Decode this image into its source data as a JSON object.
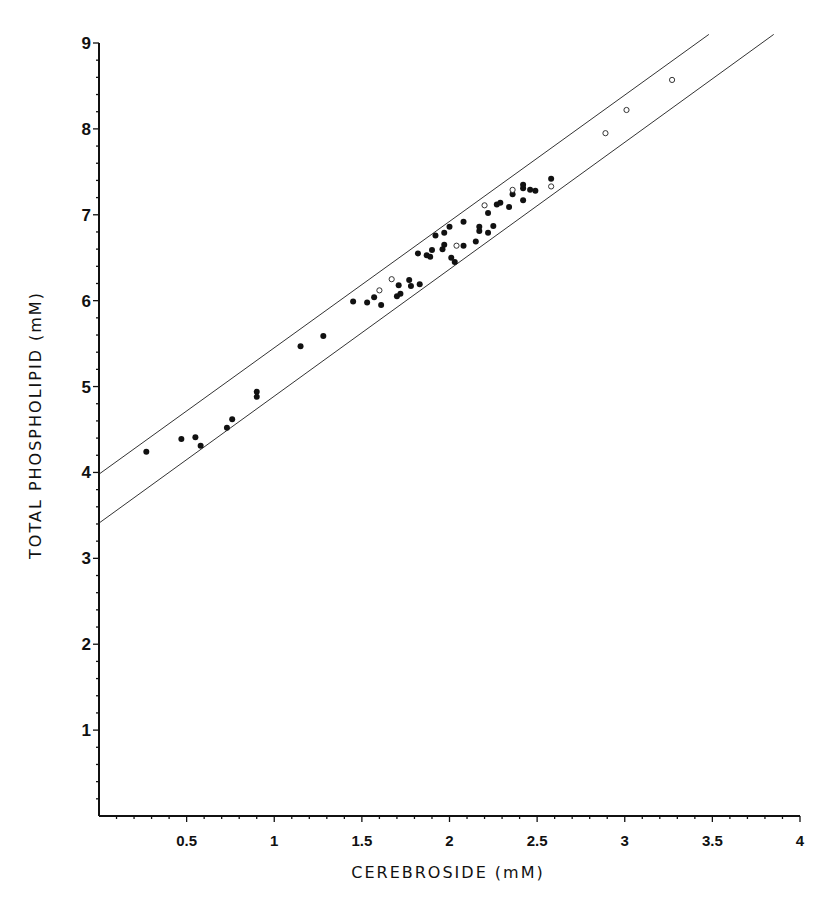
{
  "chart_data": {
    "type": "scatter",
    "title": "",
    "xlabel": "CEREBROSIDE (mM)",
    "ylabel": "TOTAL PHOSPHOLIPID (mM)",
    "xlim": [
      0,
      4
    ],
    "ylim": [
      0,
      9
    ],
    "grid": false,
    "legend": null,
    "x_ticks": [
      0.5,
      1,
      1.5,
      2,
      2.5,
      3,
      3.5,
      4
    ],
    "x_tick_labels": [
      "0.5",
      "1",
      "1.5",
      "2",
      "2.5",
      "3",
      "3.5",
      "4"
    ],
    "y_ticks": [
      1,
      2,
      3,
      4,
      5,
      6,
      7,
      8,
      9
    ],
    "y_tick_labels": [
      "1",
      "2",
      "3",
      "4",
      "5",
      "6",
      "7",
      "8",
      "9"
    ],
    "x_minor_step": 0.1,
    "y_minor_step": 0.2,
    "lines": [
      {
        "name": "upper bound",
        "x": [
          0,
          3.48
        ],
        "y": [
          3.98,
          9.1
        ]
      },
      {
        "name": "lower bound",
        "x": [
          0,
          3.85
        ],
        "y": [
          3.41,
          9.1
        ]
      }
    ],
    "series": [
      {
        "name": "filled circles",
        "marker": "filled-circle",
        "points": [
          [
            0.27,
            4.24
          ],
          [
            0.47,
            4.39
          ],
          [
            0.55,
            4.41
          ],
          [
            0.58,
            4.31
          ],
          [
            0.73,
            4.52
          ],
          [
            0.76,
            4.62
          ],
          [
            0.9,
            4.94
          ],
          [
            0.9,
            4.88
          ],
          [
            1.15,
            5.47
          ],
          [
            1.28,
            5.59
          ],
          [
            1.45,
            5.99
          ],
          [
            1.53,
            5.98
          ],
          [
            1.57,
            6.04
          ],
          [
            1.61,
            5.95
          ],
          [
            1.71,
            6.18
          ],
          [
            1.7,
            6.05
          ],
          [
            1.72,
            6.08
          ],
          [
            1.77,
            6.24
          ],
          [
            1.78,
            6.17
          ],
          [
            1.83,
            6.19
          ],
          [
            1.82,
            6.55
          ],
          [
            1.87,
            6.53
          ],
          [
            1.89,
            6.51
          ],
          [
            1.9,
            6.59
          ],
          [
            1.92,
            6.76
          ],
          [
            1.97,
            6.79
          ],
          [
            1.97,
            6.65
          ],
          [
            1.96,
            6.6
          ],
          [
            2.0,
            6.86
          ],
          [
            2.01,
            6.5
          ],
          [
            2.03,
            6.45
          ],
          [
            2.08,
            6.92
          ],
          [
            2.08,
            6.64
          ],
          [
            2.15,
            6.69
          ],
          [
            2.17,
            6.81
          ],
          [
            2.17,
            6.86
          ],
          [
            2.22,
            6.79
          ],
          [
            2.22,
            7.02
          ],
          [
            2.25,
            6.87
          ],
          [
            2.27,
            7.12
          ],
          [
            2.29,
            7.14
          ],
          [
            2.34,
            7.09
          ],
          [
            2.36,
            7.24
          ],
          [
            2.42,
            7.31
          ],
          [
            2.42,
            7.35
          ],
          [
            2.42,
            7.17
          ],
          [
            2.46,
            7.29
          ],
          [
            2.49,
            7.28
          ],
          [
            2.58,
            7.42
          ]
        ]
      },
      {
        "name": "open circles",
        "marker": "open-circle",
        "points": [
          [
            1.6,
            6.12
          ],
          [
            1.67,
            6.25
          ],
          [
            2.04,
            6.64
          ],
          [
            2.2,
            7.11
          ],
          [
            2.36,
            7.29
          ],
          [
            2.58,
            7.33
          ],
          [
            2.89,
            7.95
          ],
          [
            3.01,
            8.22
          ],
          [
            3.27,
            8.57
          ]
        ]
      }
    ]
  },
  "colors": {
    "axis": "#111111",
    "filled_marker": "#111111",
    "open_marker_stroke": "#333333",
    "band_line": "#333333",
    "background": "#ffffff"
  }
}
